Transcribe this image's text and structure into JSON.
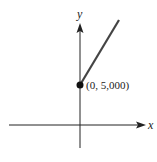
{
  "diagram": {
    "axes": {
      "x_label": "x",
      "y_label": "y"
    },
    "point": {
      "label": "(0, 5,000)",
      "x": 0,
      "y": 5000
    },
    "line": {
      "description": "ray starting at (0, 5,000) increasing to the upper right"
    },
    "colors": {
      "axes": "#222222",
      "line": "#444444",
      "point": "#111111"
    }
  }
}
